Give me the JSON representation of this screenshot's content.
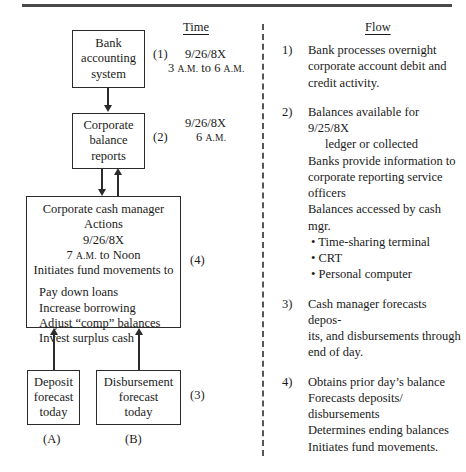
{
  "rules": {
    "top_rule": "horizontal-rule",
    "divider": "vertical-dashed-divider"
  },
  "columns": {
    "time_heading": "Time",
    "flow_heading": "Flow"
  },
  "boxes": {
    "bank": {
      "lines": [
        "Bank",
        "accounting",
        "system"
      ]
    },
    "balance": {
      "lines": [
        "Corporate",
        "balance",
        "reports"
      ]
    },
    "actions": {
      "header": [
        "Corporate cash manager",
        "Actions",
        "9/26/8X"
      ],
      "time_prefix": "7 ",
      "time_sc": "A.M.",
      "time_suffix": " to Noon",
      "initiates": "Initiates fund movements to",
      "items": [
        "Pay down loans",
        "Increase borrowing",
        "Adjust “comp” balances",
        "Invest surplus cash"
      ]
    },
    "deposit": {
      "lines": [
        "Deposit",
        "forecast",
        "today"
      ],
      "tag": "(A)"
    },
    "disbursement": {
      "lines": [
        "Disbursement",
        "forecast",
        "today"
      ],
      "tag": "(B)"
    }
  },
  "step_numbers": {
    "one": "(1)",
    "two": "(2)",
    "three": "(3)",
    "four": "(4)"
  },
  "time_column": {
    "step1_date": "9/26/8X",
    "step1_range_pre": "3 ",
    "step1_range_sc1": "A.M.",
    "step1_range_mid": " to 6 ",
    "step1_range_sc2": "A.M.",
    "step2_date": "9/26/8X",
    "step2_time_pre": "6 ",
    "step2_time_sc": "A.M."
  },
  "flow": [
    {
      "num": "1)",
      "lines": [
        {
          "text": "Bank processes overnight",
          "style": "plain"
        },
        {
          "text": "corporate account debit and",
          "style": "plain"
        },
        {
          "text": "credit activity.",
          "style": "plain"
        }
      ]
    },
    {
      "num": "2)",
      "lines": [
        {
          "text": "Balances available for 9/25/8X",
          "style": "plain"
        },
        {
          "text": "ledger or collected",
          "style": "indent"
        },
        {
          "text": "Banks provide information to",
          "style": "plain"
        },
        {
          "text": "corporate reporting service",
          "style": "plain"
        },
        {
          "text": "officers",
          "style": "plain"
        },
        {
          "text": "Balances accessed by cash mgr.",
          "style": "plain"
        },
        {
          "text": "• Time-sharing terminal",
          "style": "bullet"
        },
        {
          "text": "• CRT",
          "style": "bullet"
        },
        {
          "text": "• Personal computer",
          "style": "bullet"
        }
      ]
    },
    {
      "num": "3)",
      "lines": [
        {
          "text": "Cash manager forecasts depos-",
          "style": "plain"
        },
        {
          "text": "its, and disbursements through",
          "style": "plain"
        },
        {
          "text": "end of day.",
          "style": "plain"
        }
      ]
    },
    {
      "num": "4)",
      "lines": [
        {
          "text": "Obtains prior day’s balance",
          "style": "plain"
        },
        {
          "text": "Forecasts deposits/",
          "style": "plain"
        },
        {
          "text": "disbursements",
          "style": "plain"
        },
        {
          "text": "Determines ending balances",
          "style": "plain"
        },
        {
          "text": "Initiates fund movements.",
          "style": "plain"
        }
      ]
    }
  ],
  "colors": {
    "ink": "#1a1a1a",
    "line": "#2b2b2b",
    "rule": "#4a4a4a"
  }
}
